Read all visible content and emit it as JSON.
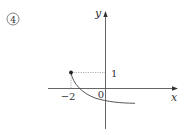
{
  "problem_number": "④",
  "graph": {
    "x_axis_label": "x",
    "y_axis_label": "y",
    "origin_label": "0",
    "tick_x_label": "−2",
    "tick_y_label": "1",
    "endpoint": {
      "x": -2,
      "y": 1,
      "filled": true
    },
    "curve_description": "decreasing curve starting at (-2,1), passing below origin, approaching a horizontal asymptote below the x-axis",
    "colors": {
      "axis": "#555555",
      "curve": "#444444",
      "dotted": "#777777"
    }
  }
}
